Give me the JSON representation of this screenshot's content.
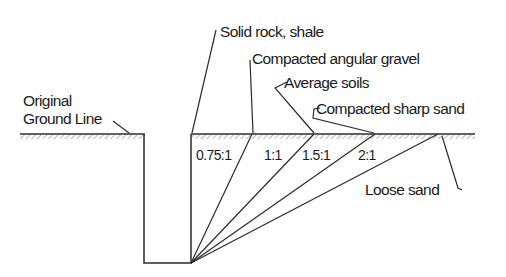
{
  "diagram": {
    "ground_label": {
      "line1": "Original",
      "line2": "Ground Line"
    },
    "soil_labels": [
      {
        "id": "solid-rock",
        "text": "Solid rock, shale"
      },
      {
        "id": "compacted-angular-gravel",
        "text": "Compacted angular gravel"
      },
      {
        "id": "average-soils",
        "text": "Average soils"
      },
      {
        "id": "compacted-sharp-sand",
        "text": "Compacted sharp sand"
      },
      {
        "id": "loose-sand",
        "text": "Loose sand"
      }
    ],
    "slope_ratios": [
      {
        "ratio": "0.75:1",
        "soil": "Compacted angular gravel"
      },
      {
        "ratio": "1:1",
        "soil": "Average soils"
      },
      {
        "ratio": "1.5:1",
        "soil": "Compacted sharp sand"
      },
      {
        "ratio": "2:1",
        "soil": "Loose sand"
      }
    ],
    "colors": {
      "line": "#2b2b2b",
      "text": "#1a1a1a",
      "background": "#ffffff",
      "hatch": "#8a8a8a"
    }
  }
}
